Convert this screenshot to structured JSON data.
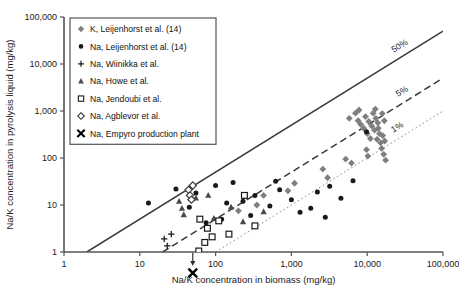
{
  "chart_data": {
    "type": "scatter",
    "title": "",
    "xlabel": "Na/K concentration in biomass (mg/kg)",
    "ylabel": "Na/K concentration in pyrolysis liquid (mg/kg)",
    "xscale": "log",
    "yscale": "log",
    "xlim": [
      1,
      100000
    ],
    "ylim": [
      1,
      100000
    ],
    "xticks": [
      "1",
      "10",
      "100",
      "1,000",
      "10,000",
      "100,000"
    ],
    "xtick_values": [
      1,
      10,
      100,
      1000,
      10000,
      100000
    ],
    "yticks": [
      "1",
      "10",
      "100",
      "1,000",
      "10,000",
      "100,000"
    ],
    "ytick_values": [
      1,
      10,
      100,
      1000,
      10000,
      100000
    ],
    "grid": false,
    "legend_position": "upper-left",
    "reference_lines": [
      {
        "label": "50%",
        "ratio": 0.5,
        "style": "solid",
        "color": "#3a3a3a"
      },
      {
        "label": "5%",
        "ratio": 0.05,
        "style": "dashed",
        "color": "#3a3a3a"
      },
      {
        "label": "1%",
        "ratio": 0.01,
        "style": "dotted",
        "color": "#8a8a8a"
      }
    ],
    "annotation": {
      "arrow": "down",
      "x": 50,
      "note": "below detection"
    },
    "series": [
      {
        "name": "K, Leijenhorst et al. (14)",
        "marker": "diamond-filled",
        "color": "#7f7f7f",
        "points": [
          [
            5800,
            700
          ],
          [
            7000,
            900
          ],
          [
            7600,
            620
          ],
          [
            8200,
            520
          ],
          [
            9000,
            430
          ],
          [
            9500,
            760
          ],
          [
            10000,
            330
          ],
          [
            10500,
            600
          ],
          [
            11000,
            260
          ],
          [
            11500,
            480
          ],
          [
            12000,
            900
          ],
          [
            12500,
            390
          ],
          [
            13000,
            700
          ],
          [
            13500,
            250
          ],
          [
            13800,
            560
          ],
          [
            14000,
            430
          ],
          [
            14500,
            330
          ],
          [
            15000,
            210
          ],
          [
            15500,
            160
          ],
          [
            16000,
            300
          ],
          [
            16500,
            120
          ],
          [
            17000,
            230
          ],
          [
            9800,
            150
          ],
          [
            10200,
            110
          ],
          [
            2600,
            58
          ],
          [
            3000,
            38
          ],
          [
            1100,
            29
          ],
          [
            900,
            20
          ],
          [
            430,
            16
          ],
          [
            5200,
            95
          ],
          [
            6200,
            78
          ],
          [
            7800,
            1050
          ],
          [
            12800,
            1100
          ],
          [
            15800,
            880
          ],
          [
            16800,
            620
          ],
          [
            17500,
            90
          ],
          [
            350,
            10
          ],
          [
            200,
            7.5
          ]
        ]
      },
      {
        "name": "Na, Leijenhorst et al. (14)",
        "marker": "circle-filled",
        "color": "#1a1a1a",
        "points": [
          [
            13,
            11
          ],
          [
            30,
            22
          ],
          [
            45,
            9
          ],
          [
            55,
            18
          ],
          [
            100,
            26
          ],
          [
            140,
            11
          ],
          [
            170,
            30
          ],
          [
            230,
            12
          ],
          [
            330,
            16
          ],
          [
            520,
            9.5
          ],
          [
            700,
            21
          ],
          [
            1000,
            13
          ],
          [
            1300,
            7
          ],
          [
            2200,
            19
          ],
          [
            3200,
            25
          ],
          [
            4500,
            14
          ],
          [
            6500,
            33
          ],
          [
            9800,
            360
          ],
          [
            290,
            6
          ],
          [
            120,
            5
          ],
          [
            75,
            4.2
          ],
          [
            1800,
            8.5
          ],
          [
            2800,
            5.5
          ],
          [
            620,
            32
          ]
        ]
      },
      {
        "name": "Na, Wiinikka et al.",
        "marker": "plus",
        "color": "#1a1a1a",
        "points": [
          [
            21,
            1.9
          ],
          [
            23,
            1.35
          ],
          [
            26,
            2.4
          ]
        ]
      },
      {
        "name": "Na, Howe et al.",
        "marker": "triangle",
        "color": "#4a4a4a",
        "points": [
          [
            33,
            12
          ],
          [
            36,
            8.5
          ],
          [
            38,
            6.2
          ],
          [
            55,
            14
          ],
          [
            80,
            16
          ],
          [
            95,
            5.2
          ],
          [
            160,
            9
          ],
          [
            230,
            4.4
          ],
          [
            430,
            7.2
          ]
        ]
      },
      {
        "name": "Na, Jendoubi et al.",
        "marker": "square-open",
        "color": "#1a1a1a",
        "points": [
          [
            60,
            1.05
          ],
          [
            72,
            1.6
          ],
          [
            78,
            3.2
          ],
          [
            90,
            2.1
          ],
          [
            110,
            4.6
          ],
          [
            150,
            2.4
          ],
          [
            240,
            16
          ],
          [
            330,
            3.6
          ],
          [
            62,
            5.0
          ]
        ]
      },
      {
        "name": "Na, Agblevor et al.",
        "marker": "diamond-open",
        "color": "#3a3a3a",
        "points": [
          [
            44,
            21
          ],
          [
            46,
            16
          ],
          [
            48,
            13
          ],
          [
            50,
            26
          ]
        ]
      },
      {
        "name": "Na, Empyro production plant",
        "marker": "x-bold",
        "color": "#000000",
        "points": [
          [
            50,
            0.72
          ]
        ]
      }
    ]
  },
  "legend": {
    "items": [
      {
        "label": "K, Leijenhorst et al. (14)",
        "marker": "diamond-filled"
      },
      {
        "label": "Na, Leijenhorst et al. (14)",
        "marker": "circle-filled"
      },
      {
        "label": "Na, Wiinikka et al.",
        "marker": "plus"
      },
      {
        "label": "Na, Howe et al.",
        "marker": "triangle"
      },
      {
        "label": "Na, Jendoubi et al.",
        "marker": "square-open"
      },
      {
        "label": "Na, Agblevor et al.",
        "marker": "diamond-open"
      },
      {
        "label": "Na, Empyro production plant",
        "marker": "x-bold"
      }
    ]
  }
}
